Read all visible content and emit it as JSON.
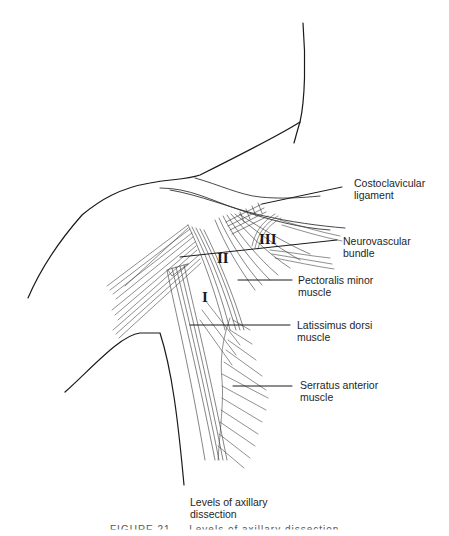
{
  "figure": {
    "title": "Levels of axillary dissection",
    "caption_partial": "FIGURE 21 — Levels of axillary dissection"
  },
  "labels": {
    "costoclavicular": "Costoclavicular\nligament",
    "neurovascular": "Neurovascular\nbundle",
    "pectoralis_minor": "Pectoralis minor\nmuscle",
    "latissimus": "Latissimus dorsi\nmuscle",
    "serratus": "Serratus anterior\nmuscle",
    "levels_title": "Levels of axillary\ndissection"
  },
  "levels": {
    "level_1": "I",
    "level_2": "II",
    "level_3": "III"
  },
  "colors": {
    "ink": "#1a1a1a",
    "label_text": "#1e1e1e",
    "background": "#ffffff"
  }
}
